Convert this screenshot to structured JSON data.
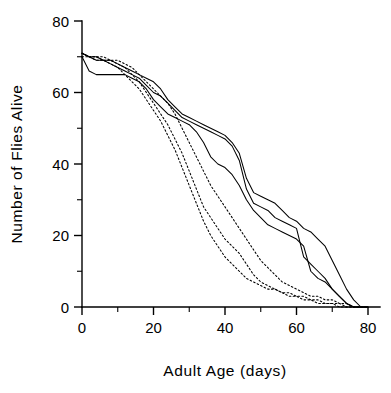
{
  "chart_data": {
    "type": "line",
    "title": "",
    "xlabel": "Adult  Age   (days)",
    "ylabel": "Number  of  Flies  Alive",
    "xlim": [
      0,
      80
    ],
    "ylim": [
      0,
      80
    ],
    "grid": false,
    "legend_position": "none",
    "x_major_ticks": [
      0,
      20,
      40,
      60,
      80
    ],
    "x_minor_ticks": [
      10,
      30,
      50,
      70
    ],
    "y_major_ticks": [
      0,
      20,
      40,
      60,
      80
    ],
    "y_minor_ticks": [
      10,
      30,
      50,
      70
    ],
    "x_tick_labels": [
      "0",
      "20",
      "40",
      "60",
      "80"
    ],
    "y_tick_labels": [
      "0",
      "20",
      "40",
      "60",
      "80"
    ],
    "series": [
      {
        "name": "solid-cohort-1",
        "style": "solid",
        "points": [
          [
            0,
            71
          ],
          [
            2,
            70
          ],
          [
            4,
            70
          ],
          [
            6,
            69
          ],
          [
            8,
            69
          ],
          [
            10,
            68
          ],
          [
            12,
            67
          ],
          [
            14,
            66
          ],
          [
            16,
            65
          ],
          [
            18,
            64
          ],
          [
            20,
            63
          ],
          [
            22,
            61
          ],
          [
            24,
            58
          ],
          [
            26,
            56
          ],
          [
            28,
            54
          ],
          [
            30,
            53
          ],
          [
            32,
            52
          ],
          [
            34,
            51
          ],
          [
            36,
            50
          ],
          [
            38,
            49
          ],
          [
            40,
            48
          ],
          [
            42,
            46
          ],
          [
            44,
            43
          ],
          [
            46,
            36
          ],
          [
            48,
            32
          ],
          [
            50,
            31
          ],
          [
            52,
            30
          ],
          [
            54,
            29
          ],
          [
            56,
            27
          ],
          [
            58,
            25
          ],
          [
            60,
            24
          ],
          [
            62,
            22
          ],
          [
            64,
            21
          ],
          [
            66,
            19
          ],
          [
            68,
            17
          ],
          [
            70,
            13
          ],
          [
            72,
            9
          ],
          [
            74,
            5
          ],
          [
            76,
            2
          ],
          [
            78,
            0
          ],
          [
            80,
            0
          ]
        ]
      },
      {
        "name": "solid-cohort-2",
        "style": "solid",
        "points": [
          [
            0,
            71
          ],
          [
            2,
            70
          ],
          [
            4,
            69
          ],
          [
            6,
            69
          ],
          [
            8,
            68
          ],
          [
            10,
            67
          ],
          [
            12,
            66
          ],
          [
            14,
            65
          ],
          [
            16,
            64
          ],
          [
            18,
            62
          ],
          [
            20,
            60
          ],
          [
            22,
            59
          ],
          [
            24,
            57
          ],
          [
            26,
            55
          ],
          [
            28,
            53
          ],
          [
            30,
            52
          ],
          [
            32,
            51
          ],
          [
            34,
            50
          ],
          [
            36,
            49
          ],
          [
            38,
            48
          ],
          [
            40,
            47
          ],
          [
            42,
            45
          ],
          [
            44,
            41
          ],
          [
            46,
            33
          ],
          [
            48,
            29
          ],
          [
            50,
            28
          ],
          [
            52,
            27
          ],
          [
            54,
            25
          ],
          [
            56,
            24
          ],
          [
            58,
            23
          ],
          [
            60,
            22
          ],
          [
            62,
            14
          ],
          [
            64,
            12
          ],
          [
            66,
            10
          ],
          [
            68,
            8
          ],
          [
            70,
            5
          ],
          [
            72,
            3
          ],
          [
            74,
            1
          ],
          [
            76,
            0
          ],
          [
            78,
            0
          ],
          [
            80,
            0
          ]
        ]
      },
      {
        "name": "solid-cohort-3",
        "style": "solid",
        "points": [
          [
            0,
            70
          ],
          [
            2,
            66
          ],
          [
            4,
            65
          ],
          [
            6,
            65
          ],
          [
            8,
            65
          ],
          [
            10,
            65
          ],
          [
            12,
            65
          ],
          [
            14,
            64
          ],
          [
            16,
            63
          ],
          [
            18,
            61
          ],
          [
            20,
            58
          ],
          [
            22,
            56
          ],
          [
            24,
            54
          ],
          [
            26,
            53
          ],
          [
            28,
            52
          ],
          [
            30,
            51
          ],
          [
            32,
            49
          ],
          [
            34,
            46
          ],
          [
            36,
            42
          ],
          [
            38,
            40
          ],
          [
            40,
            39
          ],
          [
            42,
            37
          ],
          [
            44,
            34
          ],
          [
            46,
            30
          ],
          [
            48,
            27
          ],
          [
            50,
            25
          ],
          [
            52,
            23
          ],
          [
            54,
            22
          ],
          [
            56,
            21
          ],
          [
            58,
            20
          ],
          [
            60,
            19
          ],
          [
            62,
            17
          ],
          [
            64,
            10
          ],
          [
            66,
            8
          ],
          [
            68,
            7
          ],
          [
            70,
            5
          ],
          [
            72,
            3
          ],
          [
            74,
            1
          ],
          [
            76,
            0
          ],
          [
            78,
            0
          ],
          [
            80,
            0
          ]
        ]
      },
      {
        "name": "dotted-cohort-1",
        "style": "dotted",
        "points": [
          [
            0,
            71
          ],
          [
            2,
            70
          ],
          [
            4,
            70
          ],
          [
            6,
            69
          ],
          [
            8,
            69
          ],
          [
            10,
            69
          ],
          [
            12,
            68
          ],
          [
            14,
            67
          ],
          [
            16,
            65
          ],
          [
            18,
            63
          ],
          [
            20,
            61
          ],
          [
            22,
            59
          ],
          [
            24,
            57
          ],
          [
            26,
            54
          ],
          [
            28,
            50
          ],
          [
            30,
            46
          ],
          [
            32,
            42
          ],
          [
            34,
            38
          ],
          [
            36,
            34
          ],
          [
            38,
            31
          ],
          [
            40,
            28
          ],
          [
            42,
            25
          ],
          [
            44,
            22
          ],
          [
            46,
            19
          ],
          [
            48,
            16
          ],
          [
            50,
            13
          ],
          [
            52,
            11
          ],
          [
            54,
            9
          ],
          [
            56,
            7
          ],
          [
            58,
            6
          ],
          [
            60,
            5
          ],
          [
            62,
            4
          ],
          [
            64,
            3
          ],
          [
            66,
            3
          ],
          [
            68,
            2
          ],
          [
            70,
            2
          ],
          [
            72,
            1
          ],
          [
            74,
            1
          ],
          [
            76,
            0
          ],
          [
            78,
            0
          ],
          [
            80,
            0
          ]
        ]
      },
      {
        "name": "dotted-cohort-2",
        "style": "dotted",
        "points": [
          [
            0,
            71
          ],
          [
            2,
            70
          ],
          [
            4,
            70
          ],
          [
            6,
            70
          ],
          [
            8,
            69
          ],
          [
            10,
            68
          ],
          [
            12,
            67
          ],
          [
            14,
            65
          ],
          [
            16,
            63
          ],
          [
            18,
            60
          ],
          [
            20,
            57
          ],
          [
            22,
            54
          ],
          [
            24,
            51
          ],
          [
            26,
            47
          ],
          [
            28,
            43
          ],
          [
            30,
            38
          ],
          [
            32,
            33
          ],
          [
            34,
            28
          ],
          [
            36,
            25
          ],
          [
            38,
            22
          ],
          [
            40,
            19
          ],
          [
            42,
            17
          ],
          [
            44,
            15
          ],
          [
            46,
            12
          ],
          [
            48,
            9
          ],
          [
            50,
            7
          ],
          [
            52,
            6
          ],
          [
            54,
            5
          ],
          [
            56,
            4
          ],
          [
            58,
            4
          ],
          [
            60,
            3
          ],
          [
            62,
            3
          ],
          [
            64,
            2
          ],
          [
            66,
            2
          ],
          [
            68,
            1
          ],
          [
            70,
            1
          ],
          [
            72,
            1
          ],
          [
            74,
            0
          ],
          [
            76,
            0
          ],
          [
            78,
            0
          ],
          [
            80,
            0
          ]
        ]
      },
      {
        "name": "dotted-cohort-3",
        "style": "dotted",
        "points": [
          [
            0,
            70
          ],
          [
            2,
            70
          ],
          [
            4,
            69
          ],
          [
            6,
            69
          ],
          [
            8,
            68
          ],
          [
            10,
            67
          ],
          [
            12,
            65
          ],
          [
            14,
            63
          ],
          [
            16,
            61
          ],
          [
            18,
            58
          ],
          [
            20,
            55
          ],
          [
            22,
            52
          ],
          [
            24,
            48
          ],
          [
            26,
            44
          ],
          [
            28,
            39
          ],
          [
            30,
            34
          ],
          [
            32,
            29
          ],
          [
            34,
            24
          ],
          [
            36,
            20
          ],
          [
            38,
            17
          ],
          [
            40,
            14
          ],
          [
            42,
            12
          ],
          [
            44,
            10
          ],
          [
            46,
            8
          ],
          [
            48,
            7
          ],
          [
            50,
            6
          ],
          [
            52,
            5
          ],
          [
            54,
            5
          ],
          [
            56,
            4
          ],
          [
            58,
            3
          ],
          [
            60,
            3
          ],
          [
            62,
            2
          ],
          [
            64,
            2
          ],
          [
            66,
            1
          ],
          [
            68,
            1
          ],
          [
            70,
            1
          ],
          [
            72,
            0
          ],
          [
            74,
            0
          ],
          [
            76,
            0
          ],
          [
            78,
            0
          ],
          [
            80,
            0
          ]
        ]
      }
    ]
  },
  "geometry": {
    "plot_left": 82,
    "plot_right": 368,
    "plot_top": 21,
    "plot_bottom": 307
  }
}
